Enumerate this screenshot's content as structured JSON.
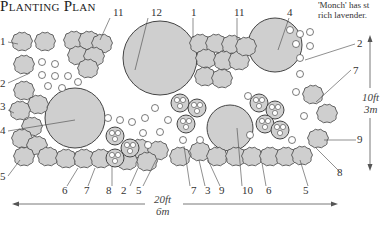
{
  "title": "Planting Plan",
  "caption": {
    "line1": "'Monch' has st",
    "line2": "rich lavender."
  },
  "dimensions": {
    "width_ft": "20ft",
    "width_m": "6m",
    "height_ft": "10ft",
    "height_m": "3m"
  },
  "labels": {
    "top": [
      "11",
      "12",
      "1",
      "11",
      "4"
    ],
    "left": [
      "1",
      "2",
      "3",
      "4",
      "5"
    ],
    "right": [
      "2",
      "7",
      "9",
      "8"
    ],
    "bottom": [
      "6",
      "7",
      "8",
      "2",
      "5",
      "7",
      "3",
      "9",
      "10",
      "6",
      "5"
    ]
  },
  "colors": {
    "fill": "#cfcfcf",
    "stroke": "#444444",
    "background": "#ffffff"
  }
}
